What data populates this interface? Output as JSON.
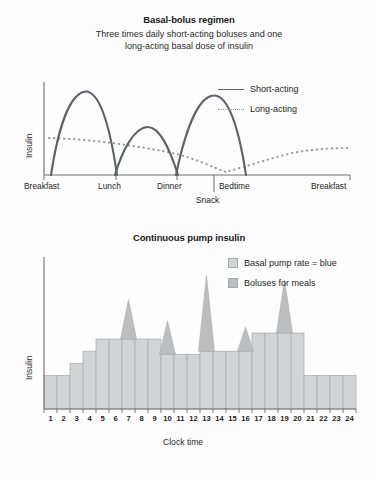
{
  "figure": {
    "background": "#fdfdfd",
    "ink": "#231f20",
    "curve_color": "#5f6168",
    "dotted_color": "#9a9a9e",
    "bar_fill": "#d2d3d5",
    "bar_stroke": "#a7a8ab",
    "bolus_fill": "#bcbdc0",
    "axis_color": "#6f6f72"
  },
  "panel_top": {
    "title": "Basal-bolus regimen",
    "subtitle_line1": "Three times daily short-acting boluses and one",
    "subtitle_line2": "long-acting basal dose of insulin",
    "ylabel": "Insulin",
    "legend": [
      {
        "label": "Short-acting",
        "style": "solid",
        "color": "#5f6168"
      },
      {
        "label": "Long-acting",
        "style": "dotted",
        "color": "#9a9a9e"
      }
    ],
    "xticks": [
      "Breakfast",
      "Lunch",
      "Dinner",
      "Bedtime",
      "Breakfast"
    ],
    "snack_label": "Snack"
  },
  "panel_bottom": {
    "title": "Continuous pump insulin",
    "ylabel": "Insulin",
    "xlabel": "Clock time",
    "legend": [
      {
        "label": "Basal pump rate = blue",
        "swatch": "basal"
      },
      {
        "label": "Boluses for meals",
        "swatch": "bolus"
      }
    ]
  },
  "chart_data": [
    {
      "type": "line",
      "title": "Basal-bolus regimen",
      "subtitle": "Three times daily short-acting boluses and one long-acting basal dose of insulin",
      "xlabel": "",
      "ylabel": "Insulin",
      "grid": false,
      "legend_position": "top-right",
      "xlim": [
        0,
        100
      ],
      "ylim": [
        0,
        100
      ],
      "xtick_labels": [
        "Breakfast",
        "Lunch",
        "Dinner",
        "Bedtime",
        "Breakfast"
      ],
      "xtick_positions": [
        6,
        30,
        50,
        62,
        96
      ],
      "annotations": [
        {
          "text": "Snack",
          "x": 58,
          "y": -14
        }
      ],
      "series": [
        {
          "name": "Short-acting",
          "style": "solid",
          "color": "#5f6168",
          "comment": "three bolus peaks following breakfast, lunch and dinner",
          "points": [
            [
              6,
              0
            ],
            [
              10,
              34
            ],
            [
              14,
              68
            ],
            [
              18,
              88
            ],
            [
              22,
              94
            ],
            [
              26,
              82
            ],
            [
              29,
              52
            ],
            [
              30.5,
              0
            ],
            [
              31,
              0
            ],
            [
              34,
              22
            ],
            [
              38,
              44
            ],
            [
              42,
              52
            ],
            [
              46,
              44
            ],
            [
              49,
              20
            ],
            [
              50.5,
              0
            ],
            [
              51,
              0
            ],
            [
              55,
              32
            ],
            [
              59,
              66
            ],
            [
              63,
              88
            ],
            [
              66,
              94
            ],
            [
              70,
              80
            ],
            [
              73,
              44
            ],
            [
              75.5,
              0
            ]
          ]
        },
        {
          "name": "Long-acting",
          "style": "dotted",
          "color": "#9a9a9e",
          "comment": "flat basal that slowly declines to a trough near bedtime, then rises again",
          "points": [
            [
              6,
              40
            ],
            [
              16,
              39
            ],
            [
              26,
              36
            ],
            [
              36,
              33
            ],
            [
              46,
              28
            ],
            [
              54,
              20
            ],
            [
              60,
              10
            ],
            [
              64,
              6
            ],
            [
              68,
              9
            ],
            [
              74,
              16
            ],
            [
              80,
              24
            ],
            [
              86,
              29
            ],
            [
              92,
              31
            ],
            [
              96,
              31
            ]
          ]
        }
      ]
    },
    {
      "type": "bar",
      "title": "Continuous pump insulin",
      "xlabel": "Clock time",
      "ylabel": "Insulin",
      "grid": false,
      "legend_position": "top-right",
      "ylim": [
        0,
        100
      ],
      "categories": [
        "1",
        "2",
        "3",
        "4",
        "5",
        "6",
        "7",
        "8",
        "9",
        "10",
        "11",
        "12",
        "13",
        "14",
        "15",
        "16",
        "17",
        "18",
        "19",
        "20",
        "21",
        "22",
        "23",
        "24"
      ],
      "series": [
        {
          "name": "Basal pump rate = blue",
          "values": [
            22,
            22,
            30,
            38,
            46,
            46,
            46,
            46,
            46,
            36,
            36,
            36,
            38,
            38,
            38,
            38,
            50,
            50,
            50,
            50,
            22,
            22,
            22,
            22
          ]
        },
        {
          "name": "Boluses for meals",
          "comment": "triangular bolus spikes drawn on top of the basal bar at the indicated hours; value is the peak height",
          "spikes": [
            {
              "hour": 7,
              "peak": 72
            },
            {
              "hour": 10,
              "peak": 58
            },
            {
              "hour": 13,
              "peak": 88
            },
            {
              "hour": 16,
              "peak": 54
            },
            {
              "hour": 19,
              "peak": 85
            }
          ]
        }
      ]
    }
  ]
}
